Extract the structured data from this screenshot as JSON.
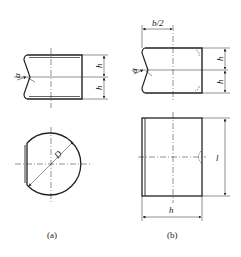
{
  "figure": {
    "panels": [
      {
        "id": "a",
        "caption": "(a)",
        "labels": {
          "angle": "α",
          "height_top": "h",
          "height_bottom": "h",
          "diameter": "D"
        }
      },
      {
        "id": "b",
        "caption": "(b)",
        "labels": {
          "half_width": "b/2",
          "angle": "α",
          "height_top": "h",
          "height_bottom": "h",
          "length": "l",
          "width": "h"
        }
      }
    ]
  }
}
